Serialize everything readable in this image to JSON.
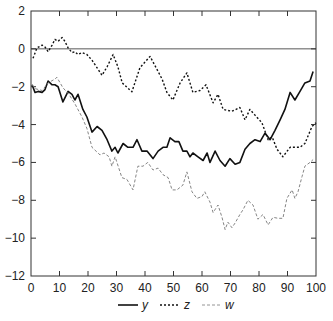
{
  "chart_data": {
    "type": "line",
    "title": "",
    "xlabel": "",
    "ylabel": "",
    "xlim": [
      0,
      100
    ],
    "ylim": [
      -12,
      2
    ],
    "x_ticks": [
      0,
      10,
      20,
      30,
      40,
      50,
      60,
      70,
      80,
      90,
      100
    ],
    "y_ticks": [
      2,
      0,
      -2,
      -4,
      -6,
      -8,
      -10,
      -12
    ],
    "y_tick_labels": [
      "2",
      "0",
      "−2",
      "−4",
      "−6",
      "−8",
      "−10",
      "−12"
    ],
    "grid": false,
    "reference_line": {
      "y": 0
    },
    "legend_position": "bottom",
    "series": [
      {
        "name": "y",
        "style": "solid",
        "color": "#111111",
        "points": [
          [
            0.4,
            -1.9
          ],
          [
            1.4,
            -2.3
          ],
          [
            2.5,
            -2.25
          ],
          [
            3.9,
            -2.3
          ],
          [
            4.9,
            -2.15
          ],
          [
            6,
            -1.7
          ],
          [
            7.4,
            -1.9
          ],
          [
            8.4,
            -1.9
          ],
          [
            9.5,
            -2.0
          ],
          [
            11.2,
            -2.8
          ],
          [
            13,
            -2.25
          ],
          [
            14.4,
            -2.4
          ],
          [
            15.4,
            -2.7
          ],
          [
            16.5,
            -2.4
          ],
          [
            18.2,
            -3.2
          ],
          [
            19.6,
            -3.6
          ],
          [
            21.4,
            -4.4
          ],
          [
            23.2,
            -4.1
          ],
          [
            24.9,
            -4.3
          ],
          [
            26.7,
            -4.8
          ],
          [
            28.4,
            -5.4
          ],
          [
            29.5,
            -5.2
          ],
          [
            30.5,
            -5.5
          ],
          [
            32.3,
            -5.0
          ],
          [
            34,
            -5.2
          ],
          [
            35.8,
            -5.2
          ],
          [
            37.2,
            -4.8
          ],
          [
            38.9,
            -5.4
          ],
          [
            40.7,
            -5.4
          ],
          [
            42.8,
            -5.8
          ],
          [
            44.6,
            -5.4
          ],
          [
            46.3,
            -5.2
          ],
          [
            47.7,
            -5.2
          ],
          [
            48.8,
            -4.7
          ],
          [
            50.5,
            -4.9
          ],
          [
            51.9,
            -4.9
          ],
          [
            53.3,
            -5.4
          ],
          [
            54.7,
            -5.4
          ],
          [
            55.8,
            -5.7
          ],
          [
            56.8,
            -5.5
          ],
          [
            58.6,
            -5.7
          ],
          [
            60.4,
            -5.9
          ],
          [
            61.8,
            -5.5
          ],
          [
            62.8,
            -6.0
          ],
          [
            64.6,
            -5.4
          ],
          [
            66.3,
            -5.9
          ],
          [
            68.1,
            -6.2
          ],
          [
            69.8,
            -5.8
          ],
          [
            71.6,
            -6.1
          ],
          [
            73.3,
            -6.0
          ],
          [
            75.1,
            -5.3
          ],
          [
            76.8,
            -5.0
          ],
          [
            78.6,
            -4.8
          ],
          [
            80.4,
            -4.9
          ],
          [
            82.1,
            -4.45
          ],
          [
            83.9,
            -4.8
          ],
          [
            85.6,
            -4.3
          ],
          [
            87.4,
            -3.75
          ],
          [
            89.1,
            -3.2
          ],
          [
            90.9,
            -2.3
          ],
          [
            92.6,
            -2.7
          ],
          [
            94.4,
            -2.25
          ],
          [
            96.1,
            -1.8
          ],
          [
            97.9,
            -1.7
          ],
          [
            99,
            -1.2
          ]
        ]
      },
      {
        "name": "z",
        "style": "dotted",
        "color": "#111111",
        "points": [
          [
            0.7,
            -0.5
          ],
          [
            2.1,
            0.05
          ],
          [
            3.9,
            0.2
          ],
          [
            4.9,
            0.1
          ],
          [
            6,
            -0.15
          ],
          [
            7.4,
            0.2
          ],
          [
            8.4,
            0.5
          ],
          [
            9.5,
            0.4
          ],
          [
            10.9,
            0.6
          ],
          [
            11.9,
            0.4
          ],
          [
            13,
            0.05
          ],
          [
            14.4,
            -0.2
          ],
          [
            15.4,
            -0.15
          ],
          [
            16.5,
            -0.3
          ],
          [
            17.9,
            -0.2
          ],
          [
            19.6,
            -0.3
          ],
          [
            21.4,
            -0.6
          ],
          [
            23.2,
            -1.0
          ],
          [
            24.9,
            -1.4
          ],
          [
            26.7,
            -0.95
          ],
          [
            28.8,
            -0.3
          ],
          [
            30.5,
            -0.95
          ],
          [
            32,
            -1.8
          ],
          [
            35.4,
            -2.27
          ],
          [
            38.2,
            -1.0
          ],
          [
            41.8,
            -0.4
          ],
          [
            46,
            -1.6
          ],
          [
            47.7,
            -2.3
          ],
          [
            49.8,
            -2.7
          ],
          [
            52.3,
            -1.8
          ],
          [
            54.7,
            -1.27
          ],
          [
            56.8,
            -2.3
          ],
          [
            59.3,
            -2.2
          ],
          [
            61.4,
            -1.9
          ],
          [
            63.9,
            -2.85
          ],
          [
            65.6,
            -2.4
          ],
          [
            67.4,
            -3.2
          ],
          [
            70.5,
            -3.3
          ],
          [
            73.3,
            -3.1
          ],
          [
            75.1,
            -3.75
          ],
          [
            76.8,
            -3.2
          ],
          [
            78.6,
            -3.5
          ],
          [
            81,
            -3.9
          ],
          [
            83.2,
            -4.8
          ],
          [
            84.6,
            -4.65
          ],
          [
            86.3,
            -5.3
          ],
          [
            88.4,
            -5.7
          ],
          [
            90.9,
            -5.2
          ],
          [
            94.4,
            -5.2
          ],
          [
            96.1,
            -5.0
          ],
          [
            98.6,
            -4.1
          ],
          [
            100,
            -3.9
          ]
        ]
      },
      {
        "name": "w",
        "style": "dashed",
        "color": "#777777",
        "points": [
          [
            0.4,
            -1.9
          ],
          [
            1.4,
            -2.1
          ],
          [
            3.9,
            -2.2
          ],
          [
            6,
            -1.8
          ],
          [
            8.4,
            -1.6
          ],
          [
            9.1,
            -1.5
          ],
          [
            11.2,
            -2.05
          ],
          [
            13.3,
            -2.4
          ],
          [
            15.4,
            -2.9
          ],
          [
            17.9,
            -3.6
          ],
          [
            19.6,
            -4.2
          ],
          [
            21.4,
            -5.2
          ],
          [
            24.2,
            -5.6
          ],
          [
            25.6,
            -5.5
          ],
          [
            27.4,
            -5.7
          ],
          [
            28.4,
            -6.2
          ],
          [
            29.5,
            -5.7
          ],
          [
            31.9,
            -6.8
          ],
          [
            33.7,
            -6.9
          ],
          [
            35.8,
            -7.45
          ],
          [
            37.5,
            -6.2
          ],
          [
            39.3,
            -6.2
          ],
          [
            41,
            -6.0
          ],
          [
            42.8,
            -6.4
          ],
          [
            44.6,
            -6.3
          ],
          [
            46.3,
            -6.65
          ],
          [
            48.1,
            -6.8
          ],
          [
            49.5,
            -7.45
          ],
          [
            51.2,
            -7.45
          ],
          [
            53.3,
            -7.2
          ],
          [
            54.7,
            -6.5
          ],
          [
            56.5,
            -7.55
          ],
          [
            58.2,
            -7.9
          ],
          [
            60,
            -7.8
          ],
          [
            61,
            -7.55
          ],
          [
            62.8,
            -8.1
          ],
          [
            63.9,
            -8.65
          ],
          [
            65.6,
            -8.25
          ],
          [
            67,
            -8.9
          ],
          [
            68.1,
            -9.55
          ],
          [
            69.1,
            -9.15
          ],
          [
            70.5,
            -9.45
          ],
          [
            71.6,
            -9.2
          ],
          [
            73.3,
            -8.75
          ],
          [
            74.4,
            -8.5
          ],
          [
            76.1,
            -8.0
          ],
          [
            77.9,
            -8.25
          ],
          [
            79.6,
            -9.0
          ],
          [
            81.4,
            -8.75
          ],
          [
            83.2,
            -9.3
          ],
          [
            84.9,
            -8.9
          ],
          [
            86.7,
            -8.95
          ],
          [
            88.4,
            -8.95
          ],
          [
            89.8,
            -7.9
          ],
          [
            91.6,
            -7.45
          ],
          [
            92.6,
            -7.9
          ],
          [
            93.7,
            -7.55
          ],
          [
            95.1,
            -6.75
          ],
          [
            96.1,
            -6.2
          ],
          [
            97.9,
            -6.0
          ],
          [
            99,
            -5.85
          ]
        ]
      }
    ],
    "legend": [
      {
        "label": "y",
        "style": "solid"
      },
      {
        "label": "z",
        "style": "dotted"
      },
      {
        "label": "w",
        "style": "dashed"
      }
    ]
  }
}
